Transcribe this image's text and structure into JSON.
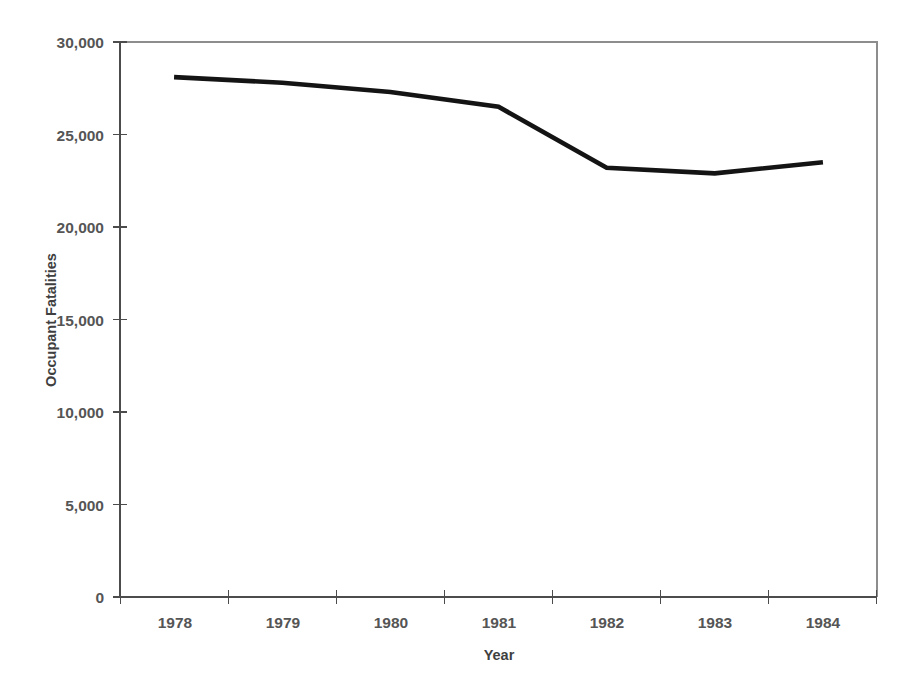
{
  "chart_data": {
    "type": "line",
    "title": "",
    "subtitle": "",
    "xlabel": "Year",
    "ylabel": "Occupant Fatalities",
    "categories": [
      "1978",
      "1979",
      "1980",
      "1981",
      "1982",
      "1983",
      "1984"
    ],
    "values": [
      28100,
      27800,
      27300,
      26500,
      23200,
      22900,
      23500
    ],
    "series": [
      {
        "name": "Occupant Fatalities",
        "color": "#141414",
        "values": [
          28100,
          27800,
          27300,
          26500,
          23200,
          22900,
          23500
        ]
      }
    ],
    "ylim": [
      0,
      30000
    ],
    "y_ticks": [
      0,
      5000,
      10000,
      15000,
      20000,
      25000,
      30000
    ],
    "y_tick_labels": [
      "0",
      "5,000",
      "10,000",
      "15,000",
      "20,000",
      "25,000",
      "30,000"
    ],
    "x_tick_labels": [
      "1978",
      "1979",
      "1980",
      "1981",
      "1982",
      "1983",
      "1984"
    ],
    "grid": false,
    "legend": "none",
    "annotations": []
  },
  "axes": {
    "y_title": "Occupant Fatalities",
    "x_title": "Year"
  },
  "colors": {
    "series": "#141414",
    "axis": "#4c4c4c",
    "frame": "#8d8d8d",
    "label": "#555555",
    "background": "#ffffff"
  }
}
